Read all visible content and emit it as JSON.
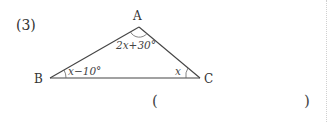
{
  "problem": {
    "number_label": "(3)"
  },
  "figure": {
    "type": "triangle",
    "vertices": {
      "A": {
        "label": "A",
        "x": 139,
        "y": 27
      },
      "B": {
        "label": "B",
        "x": 50,
        "y": 78
      },
      "C": {
        "label": "C",
        "x": 200,
        "y": 78
      }
    },
    "angles": {
      "A": {
        "expression": "2x+30°",
        "display": "2𝑥+30°"
      },
      "B": {
        "expression": "x−10°",
        "display": "𝑥−10°"
      },
      "C": {
        "expression": "x",
        "display": "𝑥"
      }
    },
    "line_color": "#444444"
  },
  "answer": {
    "open_paren": "(",
    "close_paren": ")",
    "value": ""
  }
}
